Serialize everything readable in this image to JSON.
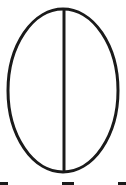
{
  "diagram": {
    "shape": "ellipse-divided-vertically",
    "stroke_color": "#1a1a1a",
    "background_color": "#ffffff",
    "ellipse": {
      "cx": 63,
      "cy": 90.5,
      "rx": 55,
      "ry": 81.5,
      "stroke_width": 3
    },
    "divider_line": {
      "x1": 64,
      "y1": 9,
      "x2": 64,
      "y2": 172,
      "stroke_width": 3
    },
    "cutoff_marks": [
      {
        "left": 0,
        "width": 8
      },
      {
        "left": 62,
        "width": 12
      },
      {
        "left": 118,
        "width": 8
      }
    ]
  }
}
